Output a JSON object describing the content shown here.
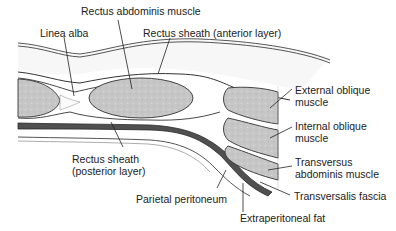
{
  "diagram": {
    "colors": {
      "muscle_fill": "#c9c9c9",
      "fat_fill": "#f4f4f4",
      "dark_fascia": "#4a4a4a",
      "outline": "#333333",
      "text": "#222222",
      "leader": "#222222"
    },
    "labels": {
      "rectus_abdominis": "Rectus abdominis muscle",
      "linea_alba": "Linea alba",
      "rectus_sheath_anterior": "Rectus sheath (anterior layer)",
      "external_oblique": {
        "line1": "External oblique",
        "line2": "muscle"
      },
      "internal_oblique": {
        "line1": "Internal oblique",
        "line2": "muscle"
      },
      "transversus": {
        "line1": "Transversus",
        "line2": "abdominis muscle"
      },
      "transversalis_fascia": "Transversalis fascia",
      "rectus_sheath_posterior": {
        "line1": "Rectus sheath",
        "line2": "(posterior layer)"
      },
      "parietal_peritoneum": "Parietal peritoneum",
      "extraperitoneal_fat": "Extraperitoneal fat"
    }
  }
}
